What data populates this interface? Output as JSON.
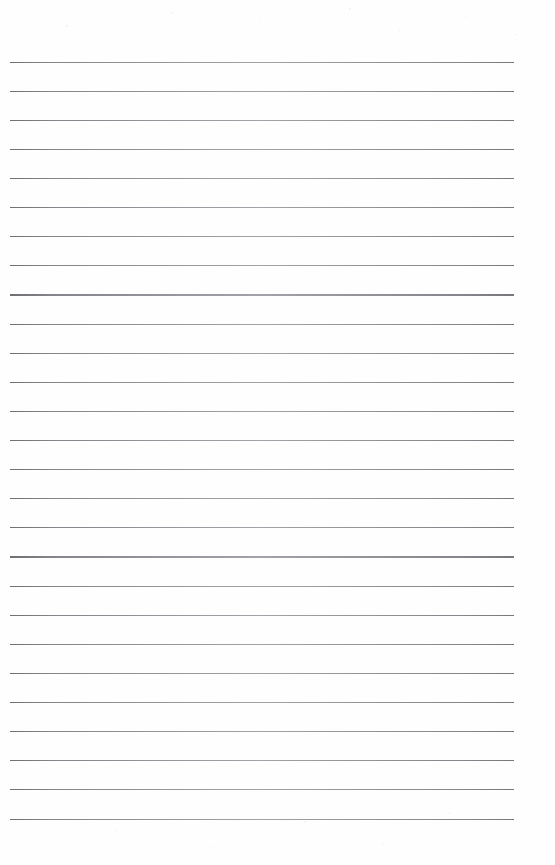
{
  "page": {
    "kind": "lined-notebook-page",
    "width_px": 555,
    "height_px": 865,
    "background_color": "#fefefe",
    "has_text": false,
    "has_handwriting": false,
    "has_margin_rule": false,
    "has_hole_punches": false,
    "text_content": ""
  },
  "ruling": {
    "line_count": 27,
    "line_color": "#8a8a8a",
    "line_thickness_px": 1.2,
    "line_spacing_px": 29.1,
    "first_line_y_px": 61.5,
    "last_line_y_px": 818.6,
    "line_start_x_px": 10,
    "line_end_x_px": 514,
    "top_margin_px": 61.5,
    "bottom_margin_px": 46.4,
    "left_margin_px": 10,
    "right_margin_px": 41,
    "lines": [
      {
        "index": 1,
        "y": 61.5,
        "content": ""
      },
      {
        "index": 2,
        "y": 90.6,
        "content": ""
      },
      {
        "index": 3,
        "y": 119.7,
        "content": ""
      },
      {
        "index": 4,
        "y": 148.8,
        "content": ""
      },
      {
        "index": 5,
        "y": 177.9,
        "content": ""
      },
      {
        "index": 6,
        "y": 207.1,
        "content": ""
      },
      {
        "index": 7,
        "y": 236.2,
        "content": ""
      },
      {
        "index": 8,
        "y": 265.3,
        "content": ""
      },
      {
        "index": 9,
        "y": 294.4,
        "content": ""
      },
      {
        "index": 10,
        "y": 323.5,
        "content": ""
      },
      {
        "index": 11,
        "y": 352.6,
        "content": ""
      },
      {
        "index": 12,
        "y": 381.7,
        "content": ""
      },
      {
        "index": 13,
        "y": 410.8,
        "content": ""
      },
      {
        "index": 14,
        "y": 440.0,
        "content": ""
      },
      {
        "index": 15,
        "y": 469.1,
        "content": ""
      },
      {
        "index": 16,
        "y": 498.2,
        "content": ""
      },
      {
        "index": 17,
        "y": 527.3,
        "content": ""
      },
      {
        "index": 18,
        "y": 556.4,
        "content": ""
      },
      {
        "index": 19,
        "y": 585.5,
        "content": ""
      },
      {
        "index": 20,
        "y": 614.6,
        "content": ""
      },
      {
        "index": 21,
        "y": 643.7,
        "content": ""
      },
      {
        "index": 22,
        "y": 672.9,
        "content": ""
      },
      {
        "index": 23,
        "y": 702.0,
        "content": ""
      },
      {
        "index": 24,
        "y": 731.1,
        "content": ""
      },
      {
        "index": 25,
        "y": 760.2,
        "content": ""
      },
      {
        "index": 26,
        "y": 789.3,
        "content": ""
      },
      {
        "index": 27,
        "y": 818.6,
        "content": ""
      }
    ]
  }
}
